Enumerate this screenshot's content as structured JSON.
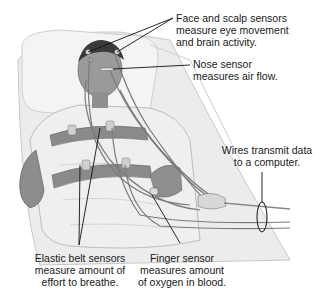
{
  "diagram": {
    "labels": {
      "face_scalp": {
        "lines": [
          "Face and scalp sensors",
          "measure eye movement",
          "and brain activity."
        ]
      },
      "nose": {
        "lines": [
          "Nose sensor",
          "measures air flow."
        ]
      },
      "wires": {
        "lines": [
          "Wires transmit data",
          "to a computer."
        ]
      },
      "belt": {
        "lines": [
          "Elastic belt sensors",
          "measure amount of",
          "effort to breathe."
        ]
      },
      "finger": {
        "lines": [
          "Finger sensor",
          "measures amount",
          "of oxygen in blood."
        ]
      }
    },
    "colors": {
      "background": "#ffffff",
      "text": "#1a1a1a",
      "leader_line": "#111111",
      "bed": "#e9e9e9",
      "skin": "#9a9a9a",
      "belt": "#8a8a8a",
      "wire": "#7a7a7a"
    }
  }
}
